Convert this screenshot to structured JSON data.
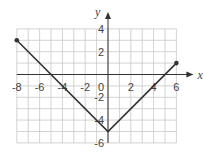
{
  "chart_data": {
    "type": "line",
    "title": "",
    "xlabel": "x",
    "ylabel": "y",
    "xlim": [
      -8,
      6
    ],
    "ylim": [
      -6,
      4
    ],
    "grid": true,
    "x_ticks": [
      -8,
      -6,
      -4,
      -2,
      2,
      4,
      6
    ],
    "y_ticks": [
      4,
      2,
      -2,
      -4,
      -6
    ],
    "origin_label": "0",
    "series": [
      {
        "name": "piecewise",
        "points": [
          [
            -8,
            3
          ],
          [
            0,
            -5
          ],
          [
            6,
            1
          ]
        ],
        "endpoints": [
          [
            -8,
            3
          ],
          [
            6,
            1
          ]
        ],
        "color": "#333333"
      }
    ]
  },
  "colors": {
    "grid": "#c8c8c8",
    "axis": "#333333",
    "line": "#333333"
  }
}
